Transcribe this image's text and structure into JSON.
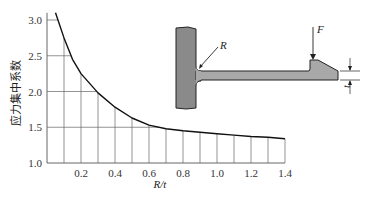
{
  "chart_data": {
    "type": "line",
    "title": "",
    "xlabel": "R/t",
    "ylabel": "应力集中系数",
    "xlim": [
      0,
      1.4
    ],
    "ylim": [
      1.0,
      3.1
    ],
    "grid": true,
    "legend": null,
    "x_ticks": [
      "0.2",
      "0.4",
      "0.6",
      "0.8",
      "1.0",
      "1.2",
      "1.4"
    ],
    "y_ticks": [
      "1.0",
      "1.5",
      "2.0",
      "2.5",
      "3.0"
    ],
    "series": [
      {
        "name": "stress concentration factor",
        "x": [
          0.05,
          0.1,
          0.15,
          0.2,
          0.3,
          0.4,
          0.5,
          0.6,
          0.7,
          0.8,
          0.9,
          1.0,
          1.1,
          1.2,
          1.3,
          1.4
        ],
        "y": [
          3.1,
          2.75,
          2.45,
          2.25,
          1.98,
          1.78,
          1.63,
          1.53,
          1.48,
          1.45,
          1.43,
          1.41,
          1.39,
          1.37,
          1.36,
          1.34
        ]
      }
    ]
  },
  "diagram": {
    "force_label": "F",
    "radius_label": "R",
    "thickness_label": "t"
  }
}
